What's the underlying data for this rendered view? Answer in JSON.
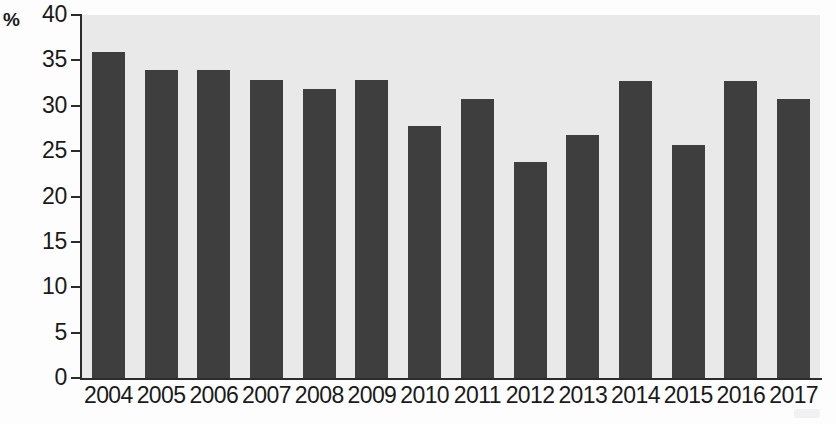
{
  "chart_data": {
    "type": "bar",
    "title": "",
    "xlabel": "",
    "ylabel": "%",
    "ylim": [
      0,
      40
    ],
    "ytick_step": 5,
    "yticks": [
      40,
      35,
      30,
      25,
      20,
      15,
      10,
      5,
      0
    ],
    "grid": false,
    "legend": null,
    "bar_color": "#3e3e3e",
    "plot_background": "#e9e9e9",
    "categories": [
      "2004",
      "2005",
      "2006",
      "2007",
      "2008",
      "2009",
      "2010",
      "2011",
      "2012",
      "2013",
      "2014",
      "2015",
      "2016",
      "2017"
    ],
    "values": [
      35.9,
      33.9,
      33.9,
      32.8,
      31.8,
      32.8,
      27.8,
      30.8,
      23.8,
      26.8,
      32.7,
      25.7,
      32.7,
      30.7
    ]
  }
}
